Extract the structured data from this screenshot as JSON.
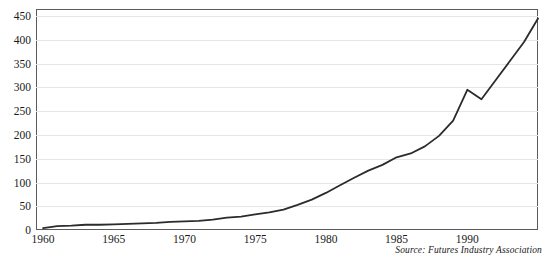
{
  "chart_data": {
    "type": "line",
    "title": "",
    "subtitle": "",
    "xlabel": "",
    "ylabel": "",
    "xlim": [
      1959.5,
      1995.0
    ],
    "ylim": [
      0,
      465
    ],
    "grid": true,
    "legend": null,
    "source_note": "Source: Futures Industry Association",
    "y_ticks": [
      0,
      50,
      100,
      150,
      200,
      250,
      300,
      350,
      400,
      450
    ],
    "y_tick_labels": [
      "0",
      "50",
      "100",
      "150",
      "200",
      "250",
      "300",
      "350",
      "400",
      "450"
    ],
    "x_ticks": [
      1960,
      1965,
      1970,
      1975,
      1980,
      1985,
      1990
    ],
    "x_tick_labels": [
      "1960",
      "1965",
      "1970",
      "1975",
      "1980",
      "1985",
      "1990"
    ],
    "series": [
      {
        "name": "Futures contracts traded",
        "color": "#2b2b2b",
        "x": [
          1960,
          1961,
          1962,
          1963,
          1964,
          1965,
          1966,
          1967,
          1968,
          1969,
          1970,
          1971,
          1972,
          1973,
          1974,
          1975,
          1976,
          1977,
          1978,
          1979,
          1980,
          1981,
          1982,
          1983,
          1984,
          1985,
          1986,
          1987,
          1988,
          1989,
          1990,
          1991,
          1992,
          1993,
          1994,
          1995
        ],
        "values": [
          4,
          8,
          9,
          11,
          11,
          12,
          13,
          14,
          15,
          17,
          18,
          19,
          22,
          26,
          28,
          33,
          37,
          43,
          53,
          64,
          78,
          94,
          110,
          125,
          137,
          153,
          161,
          176,
          198,
          230,
          295,
          275,
          315,
          355,
          395,
          445
        ]
      }
    ]
  }
}
